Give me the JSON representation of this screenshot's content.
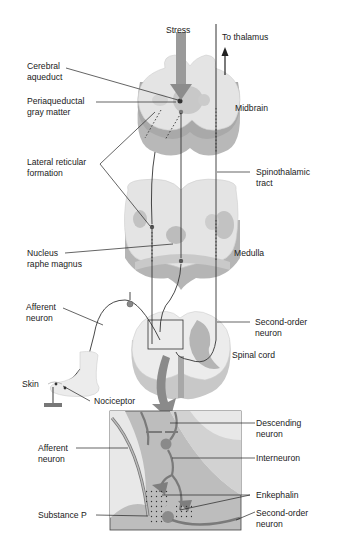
{
  "colors": {
    "tissue_light": "#e6e6e6",
    "tissue_side": "#bdbdbd",
    "gray_matter": "#b5b5b5",
    "arrow_gray": "#8c8c8c",
    "inset_bg": "#bdbdbd",
    "inset_dark": "#9e9e9e",
    "line": "#222222"
  },
  "labels": {
    "stress": "Stress",
    "to_thalamus": "To thalamus",
    "cerebral_aqueduct": "Cerebral\naqueduct",
    "periaqueductal": "Periaqueductal\ngray matter",
    "midbrain": "Midbrain",
    "lateral_reticular": "Lateral reticular\nformation",
    "spinothalamic": "Spinothalamic\ntract",
    "nucleus_raphe": "Nucleus\nraphe magnus",
    "medulla": "Medulla",
    "afferent_neuron_top": "Afferent\nneuron",
    "second_order_top": "Second-order\nneuron",
    "spinal_cord": "Spinal cord",
    "skin": "Skin",
    "nociceptor": "Nociceptor",
    "descending_neuron": "Descending\nneuron",
    "afferent_neuron_inset": "Afferent\nneuron",
    "interneuron": "Interneuron",
    "enkephalin": "Enkephalin",
    "substance_p": "Substance P",
    "second_order_inset": "Second-order\nneuron"
  }
}
